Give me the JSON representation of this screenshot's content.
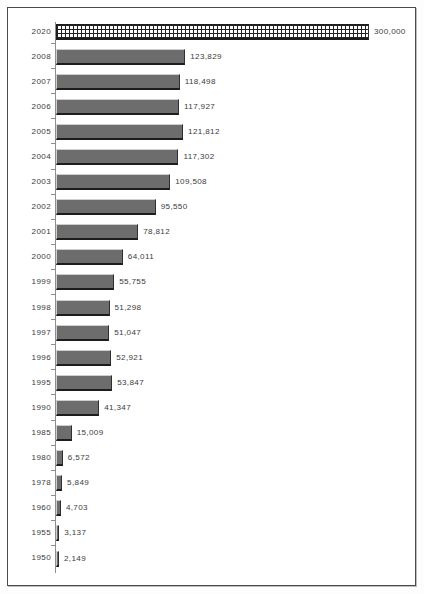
{
  "chart_data": {
    "type": "bar",
    "orientation": "horizontal",
    "title": "",
    "subtitle": "",
    "xlabel": "",
    "ylabel": "",
    "grid": false,
    "legend": null,
    "legend_position": "none",
    "xlim": [
      0,
      300000
    ],
    "axis_visible": {
      "category_axis": true,
      "value_axis": false
    },
    "value_label_format": "comma-separated thousands",
    "categories": [
      "2020",
      "2008",
      "2007",
      "2006",
      "2005",
      "2004",
      "2003",
      "2002",
      "2001",
      "2000",
      "1999",
      "1998",
      "1997",
      "1996",
      "1995",
      "1990",
      "1985",
      "1980",
      "1978",
      "1960",
      "1955",
      "1950"
    ],
    "values": [
      300000,
      123829,
      118498,
      117927,
      121812,
      117302,
      109508,
      95550,
      78812,
      64011,
      55755,
      51298,
      51047,
      52921,
      53847,
      41347,
      15009,
      6572,
      5849,
      4703,
      3137,
      2149
    ],
    "value_labels": [
      "300,000",
      "123,829",
      "118,498",
      "117,927",
      "121,812",
      "117,302",
      "109,508",
      "95,550",
      "78,812",
      "64,011",
      "55,755",
      "51,298",
      "51,047",
      "52,921",
      "53,847",
      "41,347",
      "15,009",
      "6,572",
      "5,849",
      "4,703",
      "3,137",
      "2,149"
    ],
    "series": [
      {
        "name": "value",
        "values": [
          300000,
          123829,
          118498,
          117927,
          121812,
          117302,
          109508,
          95550,
          78812,
          64011,
          55755,
          51298,
          51047,
          52921,
          53847,
          41347,
          15009,
          6572,
          5849,
          4703,
          3137,
          2149
        ]
      }
    ],
    "highlighted_categories": [
      "2020"
    ],
    "annotations": [
      {
        "category": "2020",
        "note": "projected / target value drawn with cross-hatch fill"
      }
    ],
    "colors": {
      "bar_fill": "#6d6d6d",
      "bar_highlight_fill": "#ffffff",
      "bar_highlight_pattern": "#222222",
      "bar_edge_dark": "#1d1d1d",
      "bar_edge_light": "#cfcfcf",
      "axis": "#8e8e8e",
      "text": "#3c3c3c",
      "frame": "#4a4a4a",
      "background": "#ffffff"
    }
  }
}
